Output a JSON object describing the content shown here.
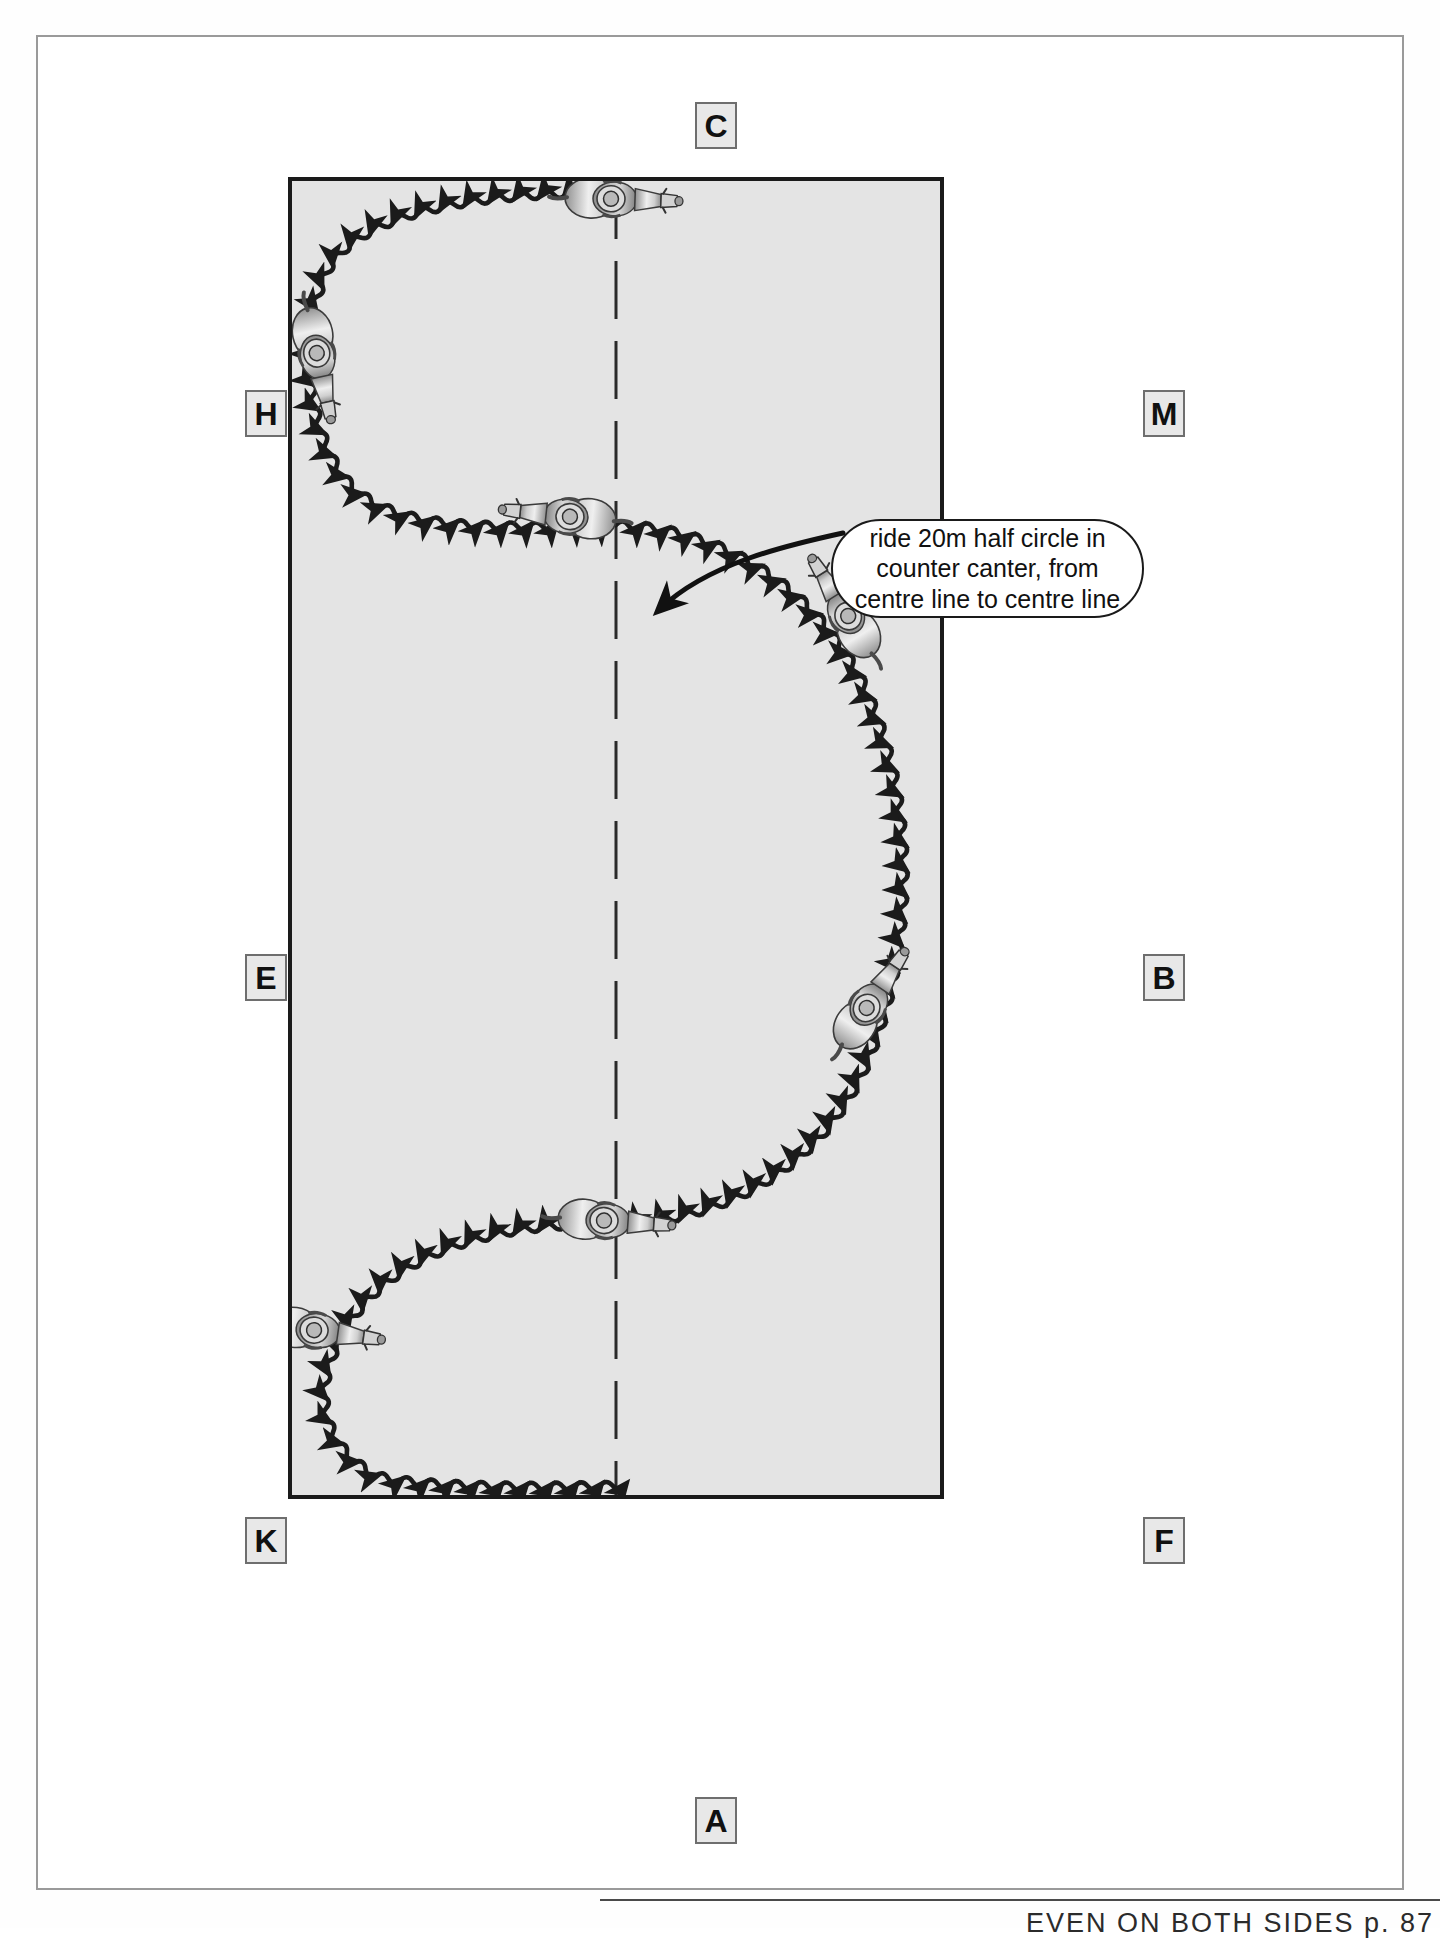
{
  "page": {
    "background_color": "#ffffff",
    "frame_color": "#9a9a9a"
  },
  "arena": {
    "fill_color": "#e4e4e4",
    "border_color": "#1a1a1a",
    "centre_line": {
      "style": "dashed",
      "label": "centre-line"
    },
    "short_side_top": "C",
    "short_side_bottom": "A"
  },
  "markers": [
    {
      "id": "marker-c",
      "label": "C",
      "side": "top",
      "x": 693,
      "y": 100
    },
    {
      "id": "marker-h",
      "label": "H",
      "side": "left",
      "x": 243,
      "y": 388
    },
    {
      "id": "marker-m",
      "label": "M",
      "side": "right",
      "x": 1141,
      "y": 388
    },
    {
      "id": "marker-e",
      "label": "E",
      "side": "left",
      "x": 243,
      "y": 952
    },
    {
      "id": "marker-b",
      "label": "B",
      "side": "right",
      "x": 1141,
      "y": 952
    },
    {
      "id": "marker-k",
      "label": "K",
      "side": "left",
      "x": 243,
      "y": 1515
    },
    {
      "id": "marker-f",
      "label": "F",
      "side": "right",
      "x": 1141,
      "y": 1515
    },
    {
      "id": "marker-a",
      "label": "A",
      "side": "bottom",
      "x": 693,
      "y": 1795
    }
  ],
  "callout": {
    "name": "exercise-instruction-callout",
    "lines": [
      "ride 20m half circle in",
      "counter canter, from",
      "centre line to centre line"
    ],
    "full_text": "ride 20m half circle in counter canter, from centre line to centre line",
    "background_color": "#ffffff",
    "border_color": "#1a1a1a",
    "arrow_target": "centre line at half-circle transition point"
  },
  "track": {
    "name": "counter-canter-serpentine-track",
    "line_style": "wavy with directional arrowheads",
    "color": "#1b1b1b",
    "description": "Large serpentine: half circle left from centre line near C, across to the right track, large half circle down the long side, then half circle back to centre line near A"
  },
  "horses": [
    {
      "id": "horse-1",
      "label": "horse-top-centre",
      "x": 505,
      "y": 138,
      "rotation": 180
    },
    {
      "id": "horse-2",
      "label": "horse-left-H",
      "x": 258,
      "y": 262,
      "rotation": 258
    },
    {
      "id": "horse-3",
      "label": "horse-centre-upper",
      "x": 452,
      "y": 456,
      "rotation": 8
    },
    {
      "id": "horse-4",
      "label": "horse-right-upper",
      "x": 772,
      "y": 548,
      "rotation": 56
    },
    {
      "id": "horse-5",
      "label": "horse-right-lower",
      "x": 787,
      "y": 927,
      "rotation": 128
    },
    {
      "id": "horse-6",
      "label": "horse-centre-lower",
      "x": 500,
      "y": 1080,
      "rotation": 186
    },
    {
      "id": "horse-7",
      "label": "horse-left-K",
      "x": 256,
      "y": 1192,
      "rotation": 188
    }
  ],
  "footer": {
    "note": "EVEN ON BOTH SIDES p. 87"
  }
}
